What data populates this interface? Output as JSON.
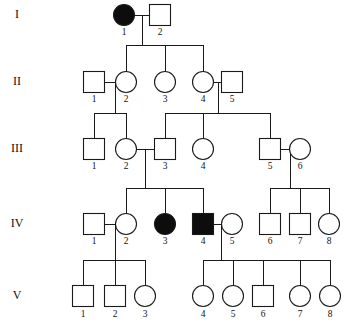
{
  "diagram": {
    "type": "pedigree",
    "colors": {
      "line": "#1a1a1a",
      "affected_fill": "#0d0d0d",
      "unaffected_fill": "#ffffff",
      "background": "#ffffff",
      "text": "#111111"
    },
    "legend_shapes": {
      "square": "male",
      "circle": "female",
      "filled": "affected",
      "open": "unaffected"
    }
  },
  "generations": [
    {
      "label": "I",
      "label_x": 17,
      "row_y": 15
    },
    {
      "label": "II",
      "label_x": 17,
      "row_y": 82
    },
    {
      "label": "III",
      "label_x": 17,
      "row_y": 149
    },
    {
      "label": "IV",
      "label_x": 17,
      "row_y": 224
    },
    {
      "label": "V",
      "label_x": 17,
      "row_y": 296
    }
  ],
  "individuals": [
    {
      "id": "I-1",
      "generation": "I",
      "number": "1",
      "sex": "female",
      "affected": true,
      "cx": 124,
      "cy": 15,
      "r": 10.5,
      "num_x": 124,
      "num_y": 35
    },
    {
      "id": "I-2",
      "generation": "I",
      "number": "2",
      "sex": "male",
      "affected": false,
      "cx": 160,
      "cy": 15,
      "r": 10.5,
      "num_x": 160,
      "num_y": 35
    },
    {
      "id": "II-1",
      "generation": "II",
      "number": "1",
      "sex": "male",
      "affected": false,
      "cx": 94,
      "cy": 82,
      "r": 10.5,
      "num_x": 94,
      "num_y": 102
    },
    {
      "id": "II-2",
      "generation": "II",
      "number": "2",
      "sex": "female",
      "affected": false,
      "cx": 126,
      "cy": 82,
      "r": 10.5,
      "num_x": 126,
      "num_y": 102
    },
    {
      "id": "II-3",
      "generation": "II",
      "number": "3",
      "sex": "female",
      "affected": false,
      "cx": 165,
      "cy": 82,
      "r": 10.5,
      "num_x": 165,
      "num_y": 102
    },
    {
      "id": "II-4",
      "generation": "II",
      "number": "4",
      "sex": "female",
      "affected": false,
      "cx": 203,
      "cy": 82,
      "r": 10.5,
      "num_x": 203,
      "num_y": 102
    },
    {
      "id": "II-5",
      "generation": "II",
      "number": "5",
      "sex": "male",
      "affected": false,
      "cx": 232,
      "cy": 82,
      "r": 10.5,
      "num_x": 232,
      "num_y": 102
    },
    {
      "id": "III-1",
      "generation": "III",
      "number": "1",
      "sex": "male",
      "affected": false,
      "cx": 94,
      "cy": 149,
      "r": 10.5,
      "num_x": 94,
      "num_y": 169
    },
    {
      "id": "III-2",
      "generation": "III",
      "number": "2",
      "sex": "female",
      "affected": false,
      "cx": 126,
      "cy": 149,
      "r": 10.5,
      "num_x": 126,
      "num_y": 169
    },
    {
      "id": "III-3",
      "generation": "III",
      "number": "3",
      "sex": "male",
      "affected": false,
      "cx": 165,
      "cy": 149,
      "r": 10.5,
      "num_x": 165,
      "num_y": 169
    },
    {
      "id": "III-4",
      "generation": "III",
      "number": "4",
      "sex": "female",
      "affected": false,
      "cx": 203,
      "cy": 149,
      "r": 10.5,
      "num_x": 203,
      "num_y": 169
    },
    {
      "id": "III-5",
      "generation": "III",
      "number": "5",
      "sex": "male",
      "affected": false,
      "cx": 270,
      "cy": 149,
      "r": 10.5,
      "num_x": 270,
      "num_y": 169
    },
    {
      "id": "III-6",
      "generation": "III",
      "number": "6",
      "sex": "female",
      "affected": false,
      "cx": 300,
      "cy": 149,
      "r": 10.5,
      "num_x": 300,
      "num_y": 169
    },
    {
      "id": "IV-1",
      "generation": "IV",
      "number": "1",
      "sex": "male",
      "affected": false,
      "cx": 94,
      "cy": 224,
      "r": 10.5,
      "num_x": 94,
      "num_y": 244
    },
    {
      "id": "IV-2",
      "generation": "IV",
      "number": "2",
      "sex": "female",
      "affected": false,
      "cx": 126,
      "cy": 224,
      "r": 10.5,
      "num_x": 126,
      "num_y": 244
    },
    {
      "id": "IV-3",
      "generation": "IV",
      "number": "3",
      "sex": "female",
      "affected": true,
      "cx": 165,
      "cy": 224,
      "r": 10.5,
      "num_x": 165,
      "num_y": 244
    },
    {
      "id": "IV-4",
      "generation": "IV",
      "number": "4",
      "sex": "male",
      "affected": true,
      "cx": 203,
      "cy": 224,
      "r": 10.5,
      "num_x": 203,
      "num_y": 244
    },
    {
      "id": "IV-5",
      "generation": "IV",
      "number": "5",
      "sex": "female",
      "affected": false,
      "cx": 232,
      "cy": 224,
      "r": 10.5,
      "num_x": 232,
      "num_y": 244
    },
    {
      "id": "IV-6",
      "generation": "IV",
      "number": "6",
      "sex": "male",
      "affected": false,
      "cx": 270,
      "cy": 224,
      "r": 10.5,
      "num_x": 270,
      "num_y": 244
    },
    {
      "id": "IV-7",
      "generation": "IV",
      "number": "7",
      "sex": "male",
      "affected": false,
      "cx": 300,
      "cy": 224,
      "r": 10.5,
      "num_x": 300,
      "num_y": 244
    },
    {
      "id": "IV-8",
      "generation": "IV",
      "number": "8",
      "sex": "female",
      "affected": false,
      "cx": 329,
      "cy": 224,
      "r": 10.5,
      "num_x": 329,
      "num_y": 244
    },
    {
      "id": "V-1",
      "generation": "V",
      "number": "1",
      "sex": "male",
      "affected": false,
      "cx": 83,
      "cy": 296,
      "r": 10.5,
      "num_x": 83,
      "num_y": 317
    },
    {
      "id": "V-2",
      "generation": "V",
      "number": "2",
      "sex": "male",
      "affected": false,
      "cx": 115,
      "cy": 296,
      "r": 10.5,
      "num_x": 115,
      "num_y": 317
    },
    {
      "id": "V-3",
      "generation": "V",
      "number": "3",
      "sex": "female",
      "affected": false,
      "cx": 145,
      "cy": 296,
      "r": 10.5,
      "num_x": 145,
      "num_y": 317
    },
    {
      "id": "V-4",
      "generation": "V",
      "number": "4",
      "sex": "female",
      "affected": false,
      "cx": 203,
      "cy": 296,
      "r": 10.5,
      "num_x": 203,
      "num_y": 317
    },
    {
      "id": "V-5",
      "generation": "V",
      "number": "5",
      "sex": "female",
      "affected": false,
      "cx": 233,
      "cy": 296,
      "r": 10.5,
      "num_x": 233,
      "num_y": 317
    },
    {
      "id": "V-6",
      "generation": "V",
      "number": "6",
      "sex": "male",
      "affected": false,
      "cx": 263,
      "cy": 296,
      "r": 10.5,
      "num_x": 263,
      "num_y": 317
    },
    {
      "id": "V-7",
      "generation": "V",
      "number": "7",
      "sex": "female",
      "affected": false,
      "cx": 300,
      "cy": 296,
      "r": 10.5,
      "num_x": 300,
      "num_y": 317
    },
    {
      "id": "V-8",
      "generation": "V",
      "number": "8",
      "sex": "female",
      "affected": false,
      "cx": 330,
      "cy": 296,
      "r": 10.5,
      "num_x": 330,
      "num_y": 317
    }
  ],
  "matings": [
    {
      "id": "mate-I1-I2",
      "partners": [
        "I-1",
        "I-2"
      ],
      "x1": 134.5,
      "x2": 149.5,
      "y": 15,
      "drop_x": 142,
      "drop_to": 45
    },
    {
      "id": "mate-II1-II2",
      "partners": [
        "II-1",
        "II-2"
      ],
      "x1": 104.5,
      "x2": 115.5,
      "y": 82,
      "drop_x": 115,
      "drop_to": 113
    },
    {
      "id": "mate-II4-II5",
      "partners": [
        "II-4",
        "II-5"
      ],
      "x1": 213.5,
      "x2": 221.5,
      "y": 82,
      "drop_x": 218,
      "drop_to": 113
    },
    {
      "id": "mate-III2-III3",
      "partners": [
        "III-2",
        "III-3"
      ],
      "x1": 136.5,
      "x2": 154.5,
      "y": 149,
      "drop_x": 145,
      "drop_to": 188
    },
    {
      "id": "mate-III5-III6",
      "partners": [
        "III-5",
        "III-6"
      ],
      "x1": 280.5,
      "x2": 289.5,
      "y": 149,
      "drop_x": 290,
      "drop_to": 188
    },
    {
      "id": "mate-IV1-IV2",
      "partners": [
        "IV-1",
        "IV-2"
      ],
      "x1": 104.5,
      "x2": 115.5,
      "y": 224,
      "drop_x": 115,
      "drop_to": 260
    },
    {
      "id": "mate-IV4-IV5",
      "partners": [
        "IV-4",
        "IV-5"
      ],
      "x1": 213.5,
      "x2": 221.5,
      "y": 224,
      "drop_x": 221,
      "drop_to": 260
    }
  ],
  "sibships": [
    {
      "id": "sib-gen2",
      "bar_y": 45,
      "x_from": 126,
      "x_to": 203,
      "child_x": [
        126,
        165,
        203
      ],
      "child_top": 71.5
    },
    {
      "id": "sib-gen3-left",
      "bar_y": 113,
      "x_from": 94,
      "x_to": 126,
      "child_x": [
        94,
        126
      ],
      "child_top": 138.5
    },
    {
      "id": "sib-gen3-right",
      "bar_y": 113,
      "x_from": 165,
      "x_to": 270,
      "child_x": [
        165,
        203,
        270
      ],
      "child_top": 138.5
    },
    {
      "id": "sib-gen4-left",
      "bar_y": 188,
      "x_from": 126,
      "x_to": 203,
      "child_x": [
        126,
        165,
        203
      ],
      "child_top": 213.5
    },
    {
      "id": "sib-gen4-right",
      "bar_y": 188,
      "x_from": 270,
      "x_to": 329,
      "child_x": [
        270,
        300,
        329
      ],
      "child_top": 213.5
    },
    {
      "id": "sib-gen5-left",
      "bar_y": 260,
      "x_from": 83,
      "x_to": 145,
      "child_x": [
        83,
        115,
        145
      ],
      "child_top": 285.5
    },
    {
      "id": "sib-gen5-right",
      "bar_y": 260,
      "x_from": 203,
      "x_to": 330,
      "child_x": [
        203,
        233,
        263,
        300,
        330
      ],
      "child_top": 285.5
    }
  ]
}
